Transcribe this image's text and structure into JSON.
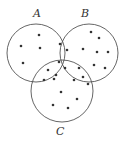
{
  "diagram": {
    "type": "venn",
    "stroke_color": "#555555",
    "dot_color": "#333333",
    "sets": [
      {
        "id": "A",
        "label": "A",
        "cx": 36,
        "cy": 53,
        "r": 29,
        "label_x": 33,
        "label_y": 8
      },
      {
        "id": "B",
        "label": "B",
        "cx": 89,
        "cy": 53,
        "r": 29,
        "label_x": 81,
        "label_y": 8
      },
      {
        "id": "C",
        "label": "C",
        "cx": 62,
        "cy": 91,
        "r": 31,
        "label_x": 56,
        "label_y": 126
      }
    ],
    "regions": [
      {
        "name": "A only",
        "count": 4,
        "points": [
          [
            39,
            35
          ],
          [
            21,
            46
          ],
          [
            40,
            48
          ],
          [
            23,
            63
          ]
        ]
      },
      {
        "name": "A and B only",
        "count": 2,
        "points": [
          [
            60,
            44
          ],
          [
            67,
            50
          ]
        ]
      },
      {
        "name": "B only",
        "count": 7,
        "points": [
          [
            91,
            32
          ],
          [
            99,
            38
          ],
          [
            83,
            49
          ],
          [
            97,
            52
          ],
          [
            108,
            52
          ],
          [
            94,
            65
          ],
          [
            105,
            68
          ]
        ]
      },
      {
        "name": "A and B and C",
        "count": 3,
        "points": [
          [
            59,
            62
          ],
          [
            65,
            68
          ],
          [
            56,
            75
          ]
        ]
      },
      {
        "name": "A and C only",
        "count": 3,
        "points": [
          [
            48,
            70
          ],
          [
            44,
            80
          ],
          [
            54,
            79
          ]
        ]
      },
      {
        "name": "B and C only",
        "count": 4,
        "points": [
          [
            79,
            68
          ],
          [
            74,
            80
          ],
          [
            83,
            77
          ],
          [
            88,
            84
          ]
        ]
      },
      {
        "name": "C only",
        "count": 4,
        "points": [
          [
            61,
            92
          ],
          [
            77,
            99
          ],
          [
            53,
            105
          ],
          [
            68,
            108
          ]
        ]
      }
    ]
  }
}
